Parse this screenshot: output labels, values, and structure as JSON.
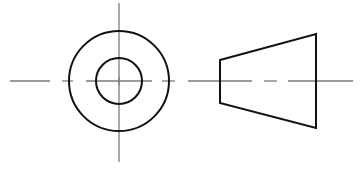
{
  "diagram": {
    "type": "orthographic-projection",
    "colors": {
      "background": "#ffffff",
      "object_line": "#111111",
      "center_line": "#7a7a7a"
    },
    "views": [
      {
        "name": "end-view",
        "shapes": [
          {
            "kind": "circle",
            "role": "outer-circle",
            "cx": 119,
            "cy": 81,
            "r": 50
          },
          {
            "kind": "circle",
            "role": "inner-circle",
            "cx": 119,
            "cy": 81,
            "r": 23
          }
        ]
      },
      {
        "name": "side-view",
        "shapes": [
          {
            "kind": "trapezoid",
            "role": "frustum-outline",
            "points": "220,60 316,34 316,128 220,103"
          }
        ]
      }
    ],
    "center_lines": {
      "horizontal_y": 81,
      "horizontal_segments": [
        [
          10,
          50
        ],
        [
          62,
          73
        ],
        [
          86,
          152
        ],
        [
          162,
          175
        ],
        [
          188,
          252
        ],
        [
          264,
          277
        ],
        [
          288,
          353
        ]
      ],
      "vertical_x": 119,
      "vertical_segments": [
        [
          3,
          162
        ]
      ],
      "center_mark": {
        "x": 119,
        "y": 81,
        "size": 4
      }
    }
  }
}
